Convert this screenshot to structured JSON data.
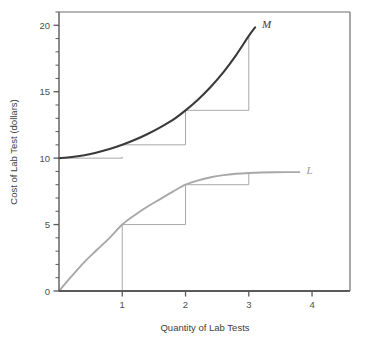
{
  "chart_data": {
    "type": "line",
    "title": "",
    "xlabel": "Quantity of Lab Tests",
    "ylabel": "Cost of Lab Test (dollars)",
    "xlim": [
      0,
      4.6
    ],
    "ylim": [
      0,
      21
    ],
    "xticks": [
      1,
      2,
      3,
      4
    ],
    "xtick_labels": [
      "1",
      "2",
      "3",
      "4"
    ],
    "yticks": [
      0,
      5,
      10,
      15,
      20
    ],
    "ytick_labels": [
      "0",
      "5",
      "10",
      "15",
      "20"
    ],
    "y_minor_tick_step": 1,
    "grid": false,
    "legend_position": "inline-end-labels",
    "series": [
      {
        "name": "M",
        "label": "M",
        "label_color": "#3a3a3a",
        "color": "#3a3a3a",
        "width": 2.1,
        "description": "Marginal cost curve, rising and convex, begins at 10 dollars",
        "points": [
          [
            0.0,
            10.0
          ],
          [
            0.2,
            10.08
          ],
          [
            0.4,
            10.22
          ],
          [
            0.6,
            10.42
          ],
          [
            0.8,
            10.68
          ],
          [
            1.0,
            11.0
          ],
          [
            1.2,
            11.38
          ],
          [
            1.4,
            11.82
          ],
          [
            1.6,
            12.32
          ],
          [
            1.8,
            12.88
          ],
          [
            2.0,
            13.6
          ],
          [
            2.2,
            14.42
          ],
          [
            2.4,
            15.38
          ],
          [
            2.6,
            16.48
          ],
          [
            2.8,
            17.76
          ],
          [
            3.0,
            19.2
          ],
          [
            3.1,
            19.85
          ]
        ]
      },
      {
        "name": "L",
        "label": "L",
        "label_color": "#9a9a9a",
        "color": "#a8a8a8",
        "width": 1.9,
        "description": "Total output curve, concave and rising to a plateau near 8.9 dollars",
        "points": [
          [
            0.0,
            0.0
          ],
          [
            0.2,
            1.12
          ],
          [
            0.4,
            2.18
          ],
          [
            0.6,
            3.1
          ],
          [
            0.8,
            4.0
          ],
          [
            1.0,
            5.0
          ],
          [
            1.2,
            5.72
          ],
          [
            1.4,
            6.36
          ],
          [
            1.6,
            6.92
          ],
          [
            1.8,
            7.48
          ],
          [
            2.0,
            8.0
          ],
          [
            2.2,
            8.32
          ],
          [
            2.4,
            8.56
          ],
          [
            2.6,
            8.72
          ],
          [
            2.8,
            8.82
          ],
          [
            3.0,
            8.88
          ],
          [
            3.2,
            8.92
          ],
          [
            3.4,
            8.94
          ],
          [
            3.6,
            8.95
          ],
          [
            3.8,
            8.95
          ]
        ]
      }
    ],
    "step_annotations": [
      {
        "series": "M",
        "description": "Rise-over-run step wedges under the M curve",
        "steps": [
          {
            "x0": 0.0,
            "x1": 1.0,
            "y0": 10.0,
            "y1": 10.0,
            "y_top": 10.1
          },
          {
            "x0": 1.0,
            "x1": 2.0,
            "y0": 11.0,
            "y1": 11.0,
            "y_top": 13.6
          },
          {
            "x0": 2.0,
            "x1": 3.0,
            "y0": 13.6,
            "y1": 13.6,
            "y_top": 19.2
          }
        ]
      },
      {
        "series": "L",
        "description": "Rise-over-run step wedges under the L curve",
        "steps": [
          {
            "x0": 1.0,
            "x1": 2.0,
            "y0": 5.0,
            "y1": 5.0,
            "y_top": 8.0
          },
          {
            "x0": 2.0,
            "x1": 3.0,
            "y0": 8.0,
            "y1": 8.0,
            "y_top": 8.9
          }
        ],
        "drop_line": {
          "x": 1.0,
          "y_from": 5.0,
          "y_to": 0.0
        }
      }
    ],
    "colors": {
      "marginal_curve": "#3a3a3a",
      "total_curve": "#a8a8a8",
      "axis": "#5a5a5a",
      "step_line": "#9e9e9e",
      "background": "#ffffff"
    }
  }
}
